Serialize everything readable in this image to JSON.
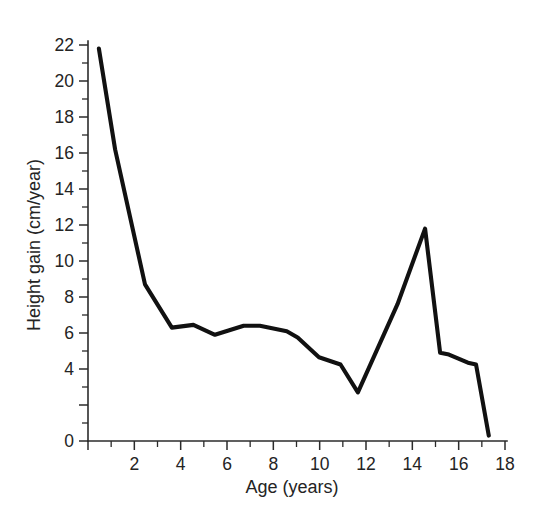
{
  "chart_data": {
    "type": "line",
    "title": "",
    "xlabel": "Age (years)",
    "ylabel": "Height gain (cm/year)",
    "xlim": [
      0,
      18
    ],
    "ylim": [
      0,
      22
    ],
    "grid": false,
    "legend": null,
    "x_ticks": [
      0,
      2,
      4,
      6,
      8,
      10,
      12,
      14,
      16,
      18
    ],
    "x_tick_labels": [
      "",
      "2",
      "4",
      "6",
      "8",
      "10",
      "12",
      "14",
      "16",
      "18"
    ],
    "x_minor_tick_step": 1,
    "y_ticks": [
      0,
      2,
      4,
      6,
      8,
      10,
      12,
      14,
      16,
      18,
      20,
      22
    ],
    "y_tick_labels": [
      "0",
      "4",
      "6",
      "8",
      "10",
      "12",
      "14",
      "16",
      "18",
      "20",
      "22"
    ],
    "y_minor_tick_step": 1,
    "series": [
      {
        "name": "Height velocity",
        "color": "#111111",
        "x": [
          0.47,
          1.17,
          2.46,
          3.62,
          4.55,
          5.48,
          6.72,
          7.42,
          8.58,
          9.05,
          9.97,
          10.9,
          11.65,
          13.36,
          14.55,
          15.2,
          15.58,
          16.4,
          16.75,
          17.3
        ],
        "y": [
          21.8,
          16.2,
          8.7,
          6.3,
          6.45,
          5.9,
          6.4,
          6.4,
          6.1,
          5.75,
          4.65,
          4.25,
          2.7,
          7.6,
          11.8,
          4.9,
          4.8,
          4.35,
          4.25,
          0.3
        ]
      }
    ]
  },
  "axis": {
    "y_label_text": "Height gain (cm/year)",
    "x_label_text": "Age (years)"
  },
  "colors": {
    "line": "#111111",
    "axis": "#2b2b2b",
    "text": "#242424",
    "background": "#ffffff"
  }
}
